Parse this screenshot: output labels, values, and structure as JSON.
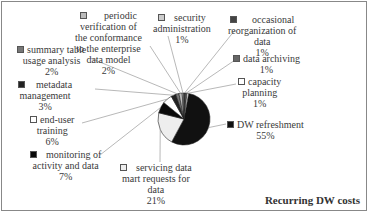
{
  "chart_data": {
    "type": "pie",
    "title": "Recurring DW costs",
    "categories": [
      "DW refreshment",
      "servicing data mart requests for data",
      "monitoring of activity and data",
      "end-user training",
      "metadata management",
      "summary table usage analysis",
      "periodic verification of the conformance to the enterprise data model",
      "security administration",
      "occasional reorganization of data",
      "data archiving",
      "capacity planning"
    ],
    "values": [
      55,
      21,
      7,
      6,
      3,
      2,
      2,
      1,
      1,
      1,
      1
    ],
    "unit": "%",
    "legend_position": "data labels around pie"
  },
  "title": "Recurring DW costs",
  "labels": {
    "dw_refresh": {
      "name": "DW refreshment",
      "pct": "55%"
    },
    "servicing": {
      "l1": "servicing data",
      "l2": "mart requests for",
      "l3": "data",
      "pct": "21%"
    },
    "monitoring": {
      "l1": "monitoring of",
      "l2": "activity and data",
      "pct": "7%"
    },
    "training": {
      "l1": "end-user",
      "l2": "training",
      "pct": "6%"
    },
    "metadata": {
      "l1": "metadata",
      "l2": "management",
      "pct": "3%"
    },
    "summary": {
      "l1": "summary table",
      "l2": "usage analysis",
      "pct": "2%"
    },
    "periodic": {
      "l1": "periodic",
      "l2": "verification of",
      "l3": "the conformance",
      "l4": "to the enterprise",
      "l5": "data model",
      "pct": "2%"
    },
    "security": {
      "l1": "security",
      "l2": "administration",
      "pct": "1%"
    },
    "occasional": {
      "l1": "occasional",
      "l2": "reorganization of",
      "l3": "data",
      "pct": "1%"
    },
    "archiving": {
      "l1": "data archiving",
      "pct": "1%"
    },
    "capacity": {
      "l1": "capacity",
      "l2": "planning",
      "pct": "1%"
    }
  },
  "colors": {
    "dw_refresh": "#111111",
    "servicing": "#eeeeee",
    "monitoring": "#0a0a0a",
    "training": "#ffffff",
    "metadata": "#222222",
    "summary": "#777777",
    "periodic": "#bbbbbb",
    "security": "#cccccc",
    "occasional": "#444444",
    "archiving": "#666666",
    "capacity": "#ffffff"
  }
}
